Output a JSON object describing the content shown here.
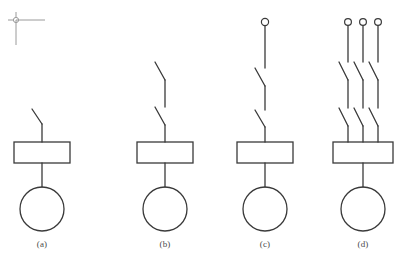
{
  "figure": {
    "type": "electrical-schematic",
    "background_color": "#ffffff",
    "stroke_color": "#3a3a3a",
    "axis_marker_color": "#9a9a9a",
    "caption_color": "#4a4a4a",
    "width": 403,
    "height": 270
  },
  "axis_marker": {
    "name": "origin-crosshair",
    "center_x": 16,
    "center_y": 20,
    "radius": 2.6,
    "horizontal_end_x": 45,
    "vertical_end_y": 45
  },
  "panels": [
    {
      "id": "a",
      "caption": "(a)",
      "caption_x": 42,
      "caption_y": 244,
      "axis_x": 42,
      "terminal": null,
      "switch_count": 1,
      "poles": 1,
      "box": {
        "x": 14,
        "y": 142,
        "width": 56,
        "height": 21
      },
      "coil": {
        "cx": 42,
        "cy": 209,
        "r": 22
      },
      "lead_top_y": 109,
      "blade_tip_x": 32,
      "blade_tip_y": 109,
      "blade_base_y": 124
    },
    {
      "id": "b",
      "caption": "(b)",
      "caption_x": 165,
      "caption_y": 244,
      "axis_x": 165,
      "terminal": null,
      "switch_count": 2,
      "poles": 1,
      "box": {
        "x": 137,
        "y": 142,
        "width": 56,
        "height": 21
      },
      "coil": {
        "cx": 165,
        "cy": 209,
        "r": 22
      },
      "lead_top_y": 62,
      "blade_tip_x": 155,
      "breaks": [
        {
          "tip_y": 62,
          "base_y": 80
        },
        {
          "tip_y": 107,
          "base_y": 125
        }
      ]
    },
    {
      "id": "c",
      "caption": "(c)",
      "caption_x": 265,
      "caption_y": 244,
      "axis_x": 265,
      "terminal": {
        "cx": 265,
        "cy": 22,
        "r": 3.6
      },
      "switch_count": 2,
      "poles": 1,
      "box": {
        "x": 237,
        "y": 142,
        "width": 56,
        "height": 21
      },
      "coil": {
        "cx": 265,
        "cy": 209,
        "r": 22
      },
      "lead_top_y": 26,
      "blade_tip_x": 255,
      "breaks": [
        {
          "tip_y": 68,
          "base_y": 86
        },
        {
          "tip_y": 110,
          "base_y": 127
        }
      ]
    },
    {
      "id": "d",
      "caption": "(d)",
      "caption_x": 363,
      "caption_y": 244,
      "axis_x": 363,
      "terminals": [
        {
          "cx": 348,
          "cy": 22,
          "r": 3.4
        },
        {
          "cx": 363,
          "cy": 22,
          "r": 3.4
        },
        {
          "cx": 378,
          "cy": 22,
          "r": 3.4
        }
      ],
      "pole_x": [
        348,
        363,
        378
      ],
      "switch_count": 2,
      "poles": 3,
      "box": {
        "x": 333,
        "y": 142,
        "width": 60,
        "height": 21
      },
      "coil": {
        "cx": 363,
        "cy": 209,
        "r": 22
      },
      "lead_top_y": 26,
      "blade_dx": -9,
      "breaks": [
        {
          "tip_y": 62,
          "base_y": 80
        },
        {
          "tip_y": 108,
          "base_y": 126
        }
      ]
    }
  ],
  "legend": {
    "box_meaning": "contactor-operating-coil-block",
    "circle_meaning": "motor-or-load-circle",
    "switch_meaning": "open-knife-switch-contact",
    "terminal_meaning": "open-circle-terminal"
  }
}
